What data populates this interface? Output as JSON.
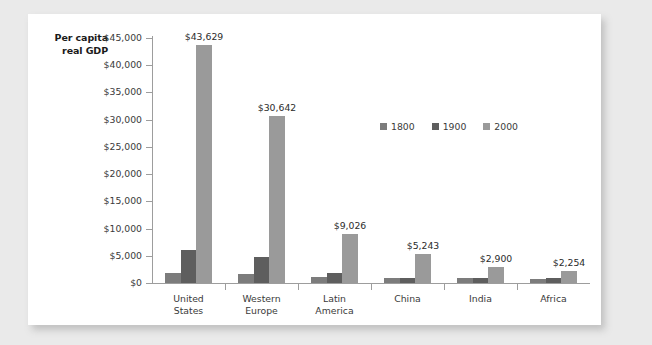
{
  "chart_data": {
    "type": "bar",
    "title": "",
    "xlabel": "",
    "ylabel": "Per capita real GDP",
    "ylim": [
      0,
      45000
    ],
    "ytick_labels": [
      "$0",
      "$5,000",
      "$10,000",
      "$15,000",
      "$20,000",
      "$25,000",
      "$30,000",
      "$35,000",
      "$40,000",
      "$45,000"
    ],
    "ytick_values": [
      0,
      5000,
      10000,
      15000,
      20000,
      25000,
      30000,
      35000,
      40000,
      45000
    ],
    "grid": false,
    "legend_position": "upper-right-inside",
    "categories": [
      "United States",
      "Western Europe",
      "Latin America",
      "China",
      "India",
      "Africa"
    ],
    "category_lines": [
      [
        "United",
        "States"
      ],
      [
        "Western",
        "Europe"
      ],
      [
        "Latin",
        "America"
      ],
      [
        "China"
      ],
      [
        "India"
      ],
      [
        "Africa"
      ]
    ],
    "series": [
      {
        "name": "1800",
        "color": "#7c7c7c",
        "values": [
          1800,
          1700,
          1100,
          900,
          850,
          750
        ],
        "labels": [
          "",
          "",
          "",
          "",
          "",
          ""
        ]
      },
      {
        "name": "1900",
        "color": "#5e5e5e",
        "values": [
          6000,
          4700,
          1800,
          900,
          900,
          1000
        ],
        "labels": [
          "",
          "",
          "",
          "",
          "",
          ""
        ]
      },
      {
        "name": "2000",
        "color": "#9a9a9a",
        "values": [
          43629,
          30642,
          9026,
          5243,
          2900,
          2254
        ],
        "labels": [
          "$43,629",
          "$30,642",
          "$9,026",
          "$5,243",
          "$2,900",
          "$2,254"
        ]
      }
    ]
  },
  "colors": {
    "page_background": "#eaeaea",
    "card_background": "#ffffff",
    "axis": "#9d9d9d",
    "text": "#3a3a3a",
    "title_text": "#1a1a1a"
  }
}
